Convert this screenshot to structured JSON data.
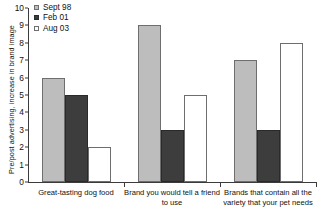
{
  "chart_data": {
    "type": "bar",
    "title": "",
    "xlabel": "",
    "ylabel": "Pre/post advertising, increase in brand image",
    "ylim": [
      0,
      10
    ],
    "yticks": [
      0,
      1,
      2,
      3,
      4,
      5,
      6,
      7,
      8,
      9,
      10
    ],
    "grid": false,
    "legend_position": "top-left",
    "categories": [
      "Great-tasting dog food",
      "Brand you would tell a friend to use",
      "Brands that contain all the variety that your pet needs"
    ],
    "series": [
      {
        "name": "Sept 98",
        "color": "#bdbdbd",
        "edge": "#6e6e6e",
        "values": [
          6,
          9,
          7
        ]
      },
      {
        "name": "Feb 01",
        "color": "#3d3d3d",
        "edge": "#2a2a2a",
        "values": [
          5,
          3,
          3
        ]
      },
      {
        "name": "Aug 03",
        "color": "#ffffff",
        "edge": "#6e6e6e",
        "values": [
          2,
          5,
          8
        ]
      }
    ]
  },
  "legend": {
    "items": [
      {
        "label": "Sept 98"
      },
      {
        "label": "Feb 01"
      },
      {
        "label": "Aug 03"
      }
    ]
  },
  "axes": {
    "y_title": "Pre/post advertising, increase in brand image",
    "y_tick_labels": [
      "0",
      "1",
      "2",
      "3",
      "4",
      "5",
      "6",
      "7",
      "8",
      "9",
      "10"
    ]
  },
  "category_labels": [
    "Great-tasting dog food",
    "Brand you would tell a friend to use",
    "Brands that contain all the variety that your pet needs"
  ]
}
